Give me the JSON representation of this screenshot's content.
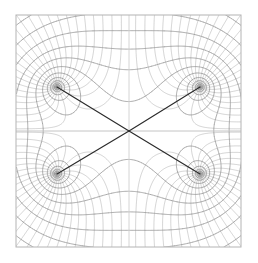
{
  "figure": {
    "title": "",
    "background_color": "#ffffff",
    "frame_color": "#b4b4b4",
    "grid_color": "#8c8c8c",
    "grid_color_light": "#aaaaaa",
    "axis_color": "#bdbdbd",
    "separatrix_color": "#2b2b2b",
    "width": 258,
    "height": 263
  },
  "chart_data": {
    "type": "line",
    "title": "",
    "subtitle": "",
    "xlabel": "",
    "ylabel": "",
    "grid": true,
    "legend_position": "none",
    "frame": {
      "x0": 16,
      "y0": 15,
      "x1": 241,
      "y1": 247
    },
    "xlim": [
      -2.5,
      2.5
    ],
    "ylim": [
      -2.58,
      2.58
    ],
    "xticks": [],
    "yticks": [],
    "xticklabels": [],
    "yticklabels": [],
    "center": {
      "x": 129,
      "y": 131,
      "label": "stagnation-point"
    },
    "foci": [
      {
        "id": "focus-upper-left",
        "x": 57,
        "y": 87
      },
      {
        "id": "focus-upper-right",
        "x": 200,
        "y": 87
      },
      {
        "id": "focus-lower-left",
        "x": 57,
        "y": 174
      },
      {
        "id": "focus-lower-right",
        "x": 200,
        "y": 174
      }
    ],
    "separatrices": [
      {
        "id": "separatrix-ul",
        "from": [
          57,
          87
        ],
        "to": [
          129,
          131
        ]
      },
      {
        "id": "separatrix-ur",
        "from": [
          200,
          87
        ],
        "to": [
          129,
          131
        ]
      },
      {
        "id": "separatrix-ll",
        "from": [
          57,
          174
        ],
        "to": [
          129,
          131
        ]
      },
      {
        "id": "separatrix-lr",
        "from": [
          200,
          174
        ],
        "to": [
          129,
          131
        ]
      }
    ],
    "axes_lines": [
      {
        "id": "horizontal-axis",
        "orientation": "horizontal",
        "value": 131
      },
      {
        "id": "vertical-axis",
        "orientation": "vertical",
        "value": 129
      }
    ],
    "series": [
      {
        "name": "equipotential-curves",
        "count": 21,
        "color": "#8c8c8c"
      },
      {
        "name": "streamline-curves",
        "count": 21,
        "color": "#8c8c8c"
      }
    ]
  }
}
